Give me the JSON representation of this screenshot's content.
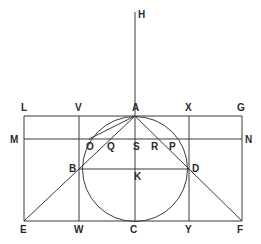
{
  "diagram": {
    "title": "",
    "colors": {
      "line": "#3a3a3a",
      "label": "#2a2a2a",
      "background": "#ffffff"
    },
    "points": {
      "H": [
        135,
        12
      ],
      "A": [
        135,
        116
      ],
      "L": [
        24,
        116
      ],
      "V": [
        79,
        116
      ],
      "X": [
        189,
        116
      ],
      "G": [
        242,
        116
      ],
      "M": [
        24,
        139
      ],
      "N": [
        242,
        139
      ],
      "O": [
        89,
        139
      ],
      "Q": [
        110,
        139
      ],
      "S": [
        135,
        139
      ],
      "R": [
        160,
        139
      ],
      "P": [
        181,
        139
      ],
      "B": [
        79,
        169
      ],
      "K": [
        135,
        169
      ],
      "D": [
        189,
        169
      ],
      "E": [
        24,
        221
      ],
      "W": [
        79,
        221
      ],
      "C": [
        135,
        221
      ],
      "Y": [
        189,
        221
      ],
      "F": [
        242,
        221
      ]
    },
    "circle": {
      "cx": 135,
      "cy": 169,
      "r": 52.5
    },
    "labels": [
      {
        "text": "H",
        "x": 138,
        "y": 18
      },
      {
        "text": "L",
        "x": 21,
        "y": 111
      },
      {
        "text": "V",
        "x": 75,
        "y": 111
      },
      {
        "text": "A",
        "x": 132,
        "y": 111
      },
      {
        "text": "X",
        "x": 185,
        "y": 111
      },
      {
        "text": "G",
        "x": 237,
        "y": 111
      },
      {
        "text": "M",
        "x": 10,
        "y": 143
      },
      {
        "text": "N",
        "x": 245,
        "y": 143
      },
      {
        "text": "O",
        "x": 86,
        "y": 150
      },
      {
        "text": "Q",
        "x": 107,
        "y": 150
      },
      {
        "text": "S",
        "x": 133,
        "y": 150
      },
      {
        "text": "R",
        "x": 151,
        "y": 150
      },
      {
        "text": "P",
        "x": 169,
        "y": 150
      },
      {
        "text": "B",
        "x": 69,
        "y": 172
      },
      {
        "text": "K",
        "x": 134,
        "y": 180
      },
      {
        "text": "D",
        "x": 192,
        "y": 172
      },
      {
        "text": "E",
        "x": 20,
        "y": 233
      },
      {
        "text": "W",
        "x": 74,
        "y": 233
      },
      {
        "text": "C",
        "x": 130,
        "y": 233
      },
      {
        "text": "Y",
        "x": 185,
        "y": 233
      },
      {
        "text": "F",
        "x": 237,
        "y": 233
      }
    ],
    "segments": [
      [
        "H",
        "C"
      ],
      [
        "L",
        "G"
      ],
      [
        "M",
        "N"
      ],
      [
        "E",
        "F"
      ],
      [
        "L",
        "E"
      ],
      [
        "G",
        "F"
      ],
      [
        "V",
        "W"
      ],
      [
        "X",
        "Y"
      ],
      [
        "B",
        "D"
      ],
      [
        "A",
        "E"
      ],
      [
        "A",
        "F"
      ],
      [
        "A",
        "O"
      ]
    ]
  }
}
